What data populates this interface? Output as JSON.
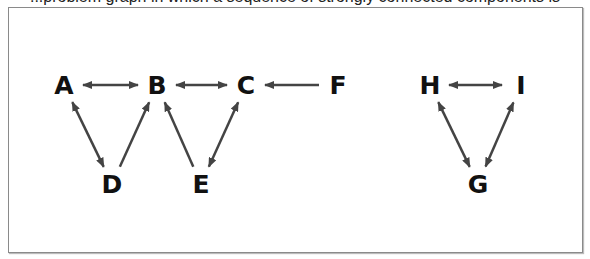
{
  "caption": "...problem graph in which a sequence of strongly connected components is computed...",
  "graph": {
    "nodes": [
      {
        "id": "A",
        "label": "A",
        "x": 64,
        "y": 85
      },
      {
        "id": "B",
        "label": "B",
        "x": 157,
        "y": 85
      },
      {
        "id": "C",
        "label": "C",
        "x": 246,
        "y": 85
      },
      {
        "id": "F",
        "label": "F",
        "x": 338,
        "y": 85
      },
      {
        "id": "D",
        "label": "D",
        "x": 112,
        "y": 184
      },
      {
        "id": "E",
        "label": "E",
        "x": 201,
        "y": 184
      },
      {
        "id": "H",
        "label": "H",
        "x": 430,
        "y": 85
      },
      {
        "id": "I",
        "label": "I",
        "x": 521,
        "y": 85
      },
      {
        "id": "G",
        "label": "G",
        "x": 478,
        "y": 184
      }
    ],
    "edges": [
      {
        "from": "A",
        "to": "B",
        "bidirectional": true
      },
      {
        "from": "B",
        "to": "C",
        "bidirectional": true
      },
      {
        "from": "F",
        "to": "C",
        "bidirectional": false
      },
      {
        "from": "A",
        "to": "D",
        "bidirectional": true
      },
      {
        "from": "D",
        "to": "B",
        "bidirectional": false
      },
      {
        "from": "E",
        "to": "B",
        "bidirectional": false
      },
      {
        "from": "C",
        "to": "E",
        "bidirectional": true
      },
      {
        "from": "H",
        "to": "I",
        "bidirectional": true
      },
      {
        "from": "H",
        "to": "G",
        "bidirectional": true
      },
      {
        "from": "I",
        "to": "G",
        "bidirectional": true
      }
    ],
    "edge_color": "#444444"
  }
}
